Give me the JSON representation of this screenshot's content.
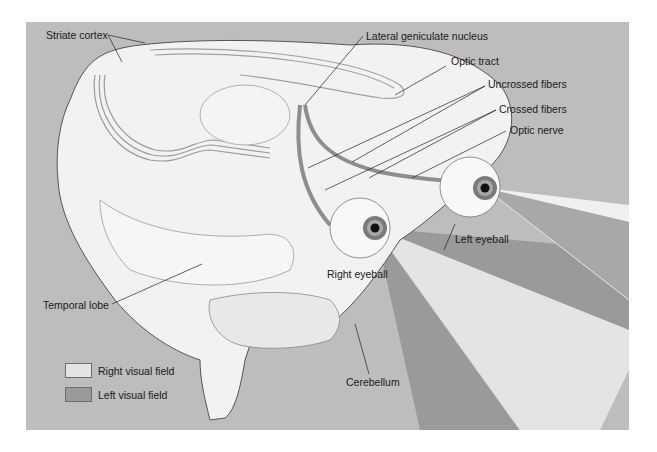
{
  "figure": {
    "labels": {
      "striate_cortex": "Striate cortex",
      "lateral_geniculate_nucleus": "Lateral geniculate nucleus",
      "optic_tract": "Optic tract",
      "uncrossed_fibers": "Uncrossed fibers",
      "crossed_fibers": "Crossed fibers",
      "optic_nerve": "Optic nerve",
      "left_eyeball": "Left eyeball",
      "right_eyeball": "Right eyeball",
      "temporal_lobe": "Temporal lobe",
      "cerebellum": "Cerebellum"
    },
    "legend": [
      {
        "label": "Right visual field",
        "color": "#e4e4e4"
      },
      {
        "label": "Left visual field",
        "color": "#9a9a9a"
      }
    ],
    "colors": {
      "background": "#bdbdbd",
      "brain": "#efefef",
      "pathway": "#8e8e8e",
      "right_field": "#e4e4e4",
      "left_field": "#9a9a9a"
    }
  }
}
